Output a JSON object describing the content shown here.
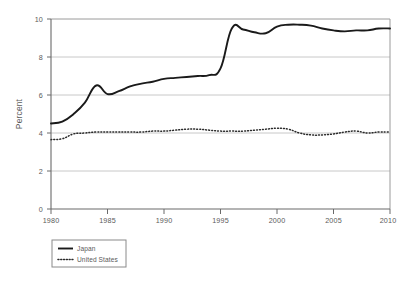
{
  "chart_data": {
    "type": "line",
    "title": "",
    "xlabel": "",
    "ylabel": "Percent",
    "xlim": [
      1980,
      2010
    ],
    "ylim": [
      0,
      10
    ],
    "xticks": [
      1980,
      1985,
      1990,
      1995,
      2000,
      2005,
      2010
    ],
    "yticks": [
      0,
      2,
      4,
      6,
      8,
      10
    ],
    "grid": "horizontal",
    "legend_position": "below-left",
    "x": [
      1980,
      1981,
      1982,
      1983,
      1984,
      1985,
      1986,
      1987,
      1988,
      1989,
      1990,
      1991,
      1992,
      1993,
      1994,
      1995,
      1996,
      1997,
      1998,
      1999,
      2000,
      2001,
      2002,
      2003,
      2004,
      2005,
      2006,
      2007,
      2008,
      2009,
      2010
    ],
    "series": [
      {
        "name": "Japan",
        "style": "solid",
        "color": "#1a1a1a",
        "values": [
          4.5,
          4.6,
          5.0,
          5.6,
          6.5,
          6.05,
          6.2,
          6.45,
          6.6,
          6.7,
          6.85,
          6.9,
          6.95,
          7.0,
          7.05,
          7.4,
          9.5,
          9.45,
          9.3,
          9.25,
          9.6,
          9.7,
          9.7,
          9.65,
          9.5,
          9.4,
          9.35,
          9.4,
          9.4,
          9.5,
          9.5
        ]
      },
      {
        "name": "United States",
        "style": "dotted",
        "color": "#2a2a2a",
        "values": [
          3.65,
          3.7,
          3.95,
          4.0,
          4.05,
          4.05,
          4.05,
          4.05,
          4.05,
          4.1,
          4.1,
          4.15,
          4.2,
          4.2,
          4.15,
          4.1,
          4.1,
          4.1,
          4.15,
          4.2,
          4.25,
          4.2,
          4.0,
          3.9,
          3.9,
          3.95,
          4.05,
          4.1,
          4.0,
          4.05,
          4.05
        ]
      }
    ],
    "legend": [
      {
        "label": "Japan",
        "style": "solid"
      },
      {
        "label": "United States",
        "style": "dotted"
      }
    ],
    "axis": {
      "y_tick_labels": [
        "0",
        "2",
        "4",
        "6",
        "8",
        "10"
      ],
      "x_tick_labels": [
        "1980",
        "1985",
        "1990",
        "1995",
        "2000",
        "2005",
        "2010"
      ]
    },
    "colors": {
      "axis": "#8a8a8a",
      "grid": "#c8c8c8",
      "japan_line": "#1a1a1a",
      "us_line": "#2a2a2a",
      "background": "#ffffff",
      "text": "#5a5a5a"
    }
  }
}
